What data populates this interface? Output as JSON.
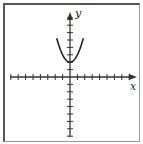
{
  "chart_data": {
    "type": "line",
    "title": "",
    "xlabel": "x",
    "ylabel": "y",
    "function": "y = x^2 + 2",
    "xlim": [
      -8,
      9
    ],
    "ylim": [
      -8,
      9
    ],
    "grid": false,
    "tick_labels": false,
    "x": [
      -1.8,
      -1.5,
      -1,
      -0.5,
      0,
      0.5,
      1,
      1.5,
      1.8
    ],
    "values": [
      5.24,
      4.25,
      3,
      2.25,
      2,
      2.25,
      3,
      4.25,
      5.24
    ],
    "vertex": [
      0,
      2
    ],
    "color": "#222222"
  },
  "axes": {
    "x_label": "x",
    "y_label": "y"
  }
}
